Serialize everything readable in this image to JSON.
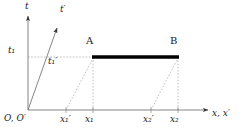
{
  "figure": {
    "type": "minkowski-spacetime-diagram",
    "background_color": "#ffffff",
    "line_color": "#555555",
    "rod_color": "#000000",
    "dash_color": "#999999",
    "text_color": "#1a1a1a"
  },
  "axes": {
    "t_label": "t",
    "t_prime_label": "t′",
    "x_label": "x, x′",
    "origin_label": "O, O′"
  },
  "ticks": {
    "t1": "t₁",
    "t1_prime": "t₁′",
    "x1_prime": "x₁′",
    "x1": "x₁",
    "x2_prime": "x₂′",
    "x2": "x₂"
  },
  "points": {
    "A": "A",
    "B": "B"
  },
  "geometry": {
    "origin": [
      28,
      110
    ],
    "t_axis_top": [
      28,
      14
    ],
    "t_prime_axis_end": [
      58,
      26
    ],
    "x_axis_end": [
      210,
      110
    ],
    "rod_left": [
      93,
      57
    ],
    "rod_right": [
      178,
      57
    ],
    "rod_thickness": 3,
    "t1_y": 57,
    "x1_prime_x": 66,
    "x1_x": 93,
    "x2_prime_x": 151,
    "x2_x": 178
  }
}
